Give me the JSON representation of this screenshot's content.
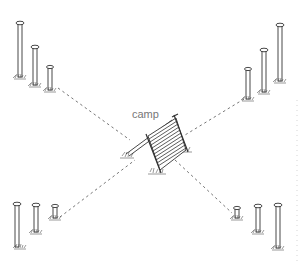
{
  "diagram": {
    "center_label": "camp",
    "colors": {
      "background": "#ffffff",
      "ink": "#333333",
      "dashed_line": "#666666",
      "label": "#777777"
    },
    "post_groups": [
      {
        "name": "top-left",
        "posts": [
          {
            "x": 20,
            "top": 22,
            "bottom": 78
          },
          {
            "x": 35,
            "top": 46,
            "bottom": 86
          },
          {
            "x": 50,
            "top": 66,
            "bottom": 91
          }
        ]
      },
      {
        "name": "top-right",
        "posts": [
          {
            "x": 280,
            "top": 24,
            "bottom": 82
          },
          {
            "x": 264,
            "top": 49,
            "bottom": 93
          },
          {
            "x": 248,
            "top": 68,
            "bottom": 100
          }
        ]
      },
      {
        "name": "bottom-left",
        "posts": [
          {
            "x": 17,
            "top": 203,
            "bottom": 248
          },
          {
            "x": 36,
            "top": 204,
            "bottom": 233
          },
          {
            "x": 55,
            "top": 205,
            "bottom": 219
          }
        ]
      },
      {
        "name": "bottom-right",
        "posts": [
          {
            "x": 237,
            "top": 207,
            "bottom": 219
          },
          {
            "x": 258,
            "top": 205,
            "bottom": 233
          },
          {
            "x": 278,
            "top": 204,
            "bottom": 249
          }
        ]
      }
    ],
    "dashed_lines": [
      {
        "from": [
          58,
          88
        ],
        "to": [
          130,
          140
        ]
      },
      {
        "from": [
          244,
          99
        ],
        "to": [
          185,
          135
        ]
      },
      {
        "from": [
          60,
          217
        ],
        "to": [
          135,
          160
        ]
      },
      {
        "from": [
          175,
          160
        ],
        "to": [
          232,
          213
        ]
      }
    ]
  }
}
